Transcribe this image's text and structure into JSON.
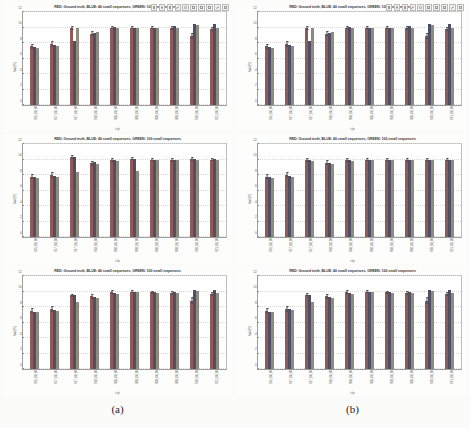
{
  "figure": {
    "captions": [
      {
        "label": "(a)"
      },
      {
        "label": "(b)"
      }
    ]
  },
  "toolbar": {
    "icons": [
      "save-icon",
      "zoom-icon",
      "pan-icon",
      "rotate-icon",
      "datacursor-icon",
      "colorbar-icon",
      "legend-icon",
      "hide-icon",
      "link-icon",
      "insert-icon"
    ]
  },
  "chart_data": [
    {
      "panel_id": "a-top",
      "type": "bar",
      "title": "RED: Ground truth, BLUE: 40 small sequences, GREEN: 100 small sequences",
      "xlabel": "clip",
      "ylabel": "Val (R)",
      "ylim": [
        0,
        12
      ],
      "yticks": [
        0,
        2,
        4,
        6,
        8,
        10,
        12
      ],
      "grid": true,
      "legend_position": "title",
      "categories": [
        "S15_08_00",
        "S17_08_00",
        "S17_08_00",
        "S18_08_00",
        "S08_08_00",
        "S08_08_00",
        "S08_08_00",
        "S08_08_00",
        "S20_08_00",
        "S21_08_00"
      ],
      "series": [
        {
          "name": "RED: Ground truth",
          "color": "#8f5a57",
          "values": [
            7.6,
            7.9,
            9.9,
            9.2,
            10.0,
            10.0,
            10.0,
            9.9,
            8.9,
            9.8
          ]
        },
        {
          "name": "BLUE: 40 small sequences",
          "color": "#4f4f63",
          "values": [
            7.5,
            7.7,
            8.3,
            9.3,
            10.1,
            10.0,
            10.0,
            10.2,
            10.4,
            10.4
          ]
        },
        {
          "name": "GREEN: 100 small sequences",
          "color": "#8b8b80",
          "values": [
            7.4,
            7.6,
            9.9,
            9.4,
            9.9,
            10.0,
            10.0,
            9.9,
            10.3,
            9.9
          ]
        }
      ],
      "errors": [
        {
          "series": "RED: Ground truth",
          "values": [
            0.5,
            0.6,
            0.3,
            0.4,
            0.25,
            0.2,
            0.2,
            0.3,
            0.6,
            0.3
          ]
        }
      ]
    },
    {
      "panel_id": "a-middle",
      "type": "bar",
      "title": "RED: Ground truth, BLUE: 40 small sequences, GREEN: 100 small sequences",
      "xlabel": "clip",
      "ylabel": "Val (R)",
      "ylim": [
        0,
        12
      ],
      "yticks": [
        0,
        2,
        4,
        6,
        8,
        10,
        12
      ],
      "grid": true,
      "legend_position": "title",
      "categories": [
        "S15_08_00",
        "S17_08_00",
        "S17_08_00",
        "S18_08_00",
        "S08_08_00",
        "S08_08_00",
        "S08_08_00",
        "S08_08_00",
        "S20_08_00",
        "S21_08_00"
      ],
      "series": [
        {
          "name": "RED: Ground truth",
          "color": "#8f5a57",
          "values": [
            7.8,
            8.0,
            10.3,
            9.5,
            9.9,
            10.1,
            10.0,
            9.9,
            10.1,
            10.0
          ]
        },
        {
          "name": "BLUE: 40 small sequences",
          "color": "#4f4f63",
          "values": [
            7.7,
            7.9,
            10.3,
            9.7,
            10.0,
            10.1,
            10.0,
            9.9,
            10.1,
            10.1
          ]
        },
        {
          "name": "GREEN: 100 small sequences",
          "color": "#8b8b80",
          "values": [
            7.6,
            7.8,
            8.4,
            9.4,
            9.8,
            8.5,
            10.0,
            9.9,
            10.0,
            9.9
          ]
        }
      ],
      "errors": [
        {
          "series": "RED: Ground truth",
          "values": [
            0.5,
            0.6,
            0.3,
            0.4,
            0.3,
            0.25,
            0.25,
            0.3,
            0.3,
            0.3
          ]
        }
      ]
    },
    {
      "panel_id": "a-bottom",
      "type": "bar",
      "title": "RED: Ground truth, BLUE: 40 small sequences, GREEN: 100 small sequences",
      "xlabel": "clip",
      "ylabel": "Val (R)",
      "ylim": [
        0,
        12
      ],
      "yticks": [
        0,
        2,
        4,
        6,
        8,
        10,
        12
      ],
      "grid": true,
      "legend_position": "title",
      "categories": [
        "S15_08_00",
        "S17_08_00",
        "S17_08_00",
        "S18_08_00",
        "S08_08_00",
        "S08_08_00",
        "S08_08_00",
        "S08_08_00",
        "S20_08_00",
        "S21_08_00"
      ],
      "series": [
        {
          "name": "RED: Ground truth",
          "color": "#8f5a57",
          "values": [
            7.5,
            7.7,
            9.5,
            9.4,
            9.9,
            10.0,
            9.9,
            9.8,
            8.8,
            9.7
          ]
        },
        {
          "name": "BLUE: 40 small sequences",
          "color": "#4f4f63",
          "values": [
            7.4,
            7.6,
            9.5,
            9.3,
            9.8,
            10.0,
            9.9,
            9.9,
            10.2,
            10.2
          ]
        },
        {
          "name": "GREEN: 100 small sequences",
          "color": "#8b8b80",
          "values": [
            7.3,
            7.5,
            8.6,
            9.2,
            9.7,
            9.9,
            9.8,
            9.8,
            10.1,
            9.8
          ]
        }
      ],
      "errors": [
        {
          "series": "RED: Ground truth",
          "values": [
            0.5,
            0.6,
            0.3,
            0.4,
            0.3,
            0.25,
            0.25,
            0.3,
            0.6,
            0.35
          ]
        }
      ]
    },
    {
      "panel_id": "b-top",
      "type": "bar",
      "title": "RED: Ground truth, BLUE: 40 small sequences, GREEN: 100 small sequences",
      "xlabel": "clip",
      "ylabel": "Val (R)",
      "ylim": [
        0,
        12
      ],
      "yticks": [
        0,
        2,
        4,
        6,
        8,
        10,
        12
      ],
      "grid": true,
      "legend_position": "title",
      "categories": [
        "S15_08_00",
        "S17_08_00",
        "S17_08_00",
        "S18_08_00",
        "S08_08_00",
        "S08_08_00",
        "S08_08_00",
        "S08_08_00",
        "S20_08_00",
        "S21_08_00"
      ],
      "series": [
        {
          "name": "RED: Ground truth",
          "color": "#8f5a57",
          "values": [
            7.6,
            7.9,
            9.9,
            9.2,
            10.0,
            10.0,
            10.0,
            9.9,
            8.9,
            9.8
          ]
        },
        {
          "name": "BLUE: 40 small sequences",
          "color": "#4f4f63",
          "values": [
            7.5,
            7.7,
            8.3,
            9.3,
            10.1,
            10.0,
            10.0,
            10.2,
            10.4,
            10.4
          ]
        },
        {
          "name": "GREEN: 100 small sequences",
          "color": "#8b8b80",
          "values": [
            7.4,
            7.6,
            9.9,
            9.4,
            9.9,
            10.0,
            10.0,
            9.9,
            10.3,
            9.9
          ]
        }
      ],
      "errors": [
        {
          "series": "RED: Ground truth",
          "values": [
            0.5,
            0.6,
            0.3,
            0.4,
            0.25,
            0.2,
            0.2,
            0.3,
            0.6,
            0.3
          ]
        }
      ]
    },
    {
      "panel_id": "b-middle",
      "type": "bar",
      "title": "RED: Ground truth, BLUE: 40 small sequences, GREEN: 100 small sequences",
      "xlabel": "clip",
      "ylabel": "Val (R)",
      "ylim": [
        0,
        12
      ],
      "yticks": [
        0,
        2,
        4,
        6,
        8,
        10,
        12
      ],
      "grid": true,
      "legend_position": "title",
      "categories": [
        "S15_08_00",
        "S17_08_00",
        "S17_08_00",
        "S18_08_00",
        "S08_08_00",
        "S08_08_00",
        "S08_08_00",
        "S08_08_00",
        "S20_08_00",
        "S21_08_00"
      ],
      "series": [
        {
          "name": "RED: Ground truth",
          "color": "#8f5a57",
          "values": [
            7.8,
            8.0,
            9.9,
            9.6,
            9.9,
            10.0,
            10.0,
            9.9,
            10.0,
            10.0
          ]
        },
        {
          "name": "BLUE: 40 small sequences",
          "color": "#4f4f63",
          "values": [
            7.7,
            7.9,
            9.9,
            9.5,
            9.9,
            10.0,
            10.0,
            10.0,
            10.0,
            10.0
          ]
        },
        {
          "name": "GREEN: 100 small sequences",
          "color": "#8b8b80",
          "values": [
            7.6,
            7.8,
            9.8,
            9.4,
            9.8,
            9.9,
            9.9,
            9.9,
            9.9,
            9.9
          ]
        }
      ],
      "errors": [
        {
          "series": "RED: Ground truth",
          "values": [
            0.5,
            0.6,
            0.3,
            0.4,
            0.3,
            0.25,
            0.25,
            0.3,
            0.3,
            0.3
          ]
        }
      ]
    },
    {
      "panel_id": "b-bottom",
      "type": "bar",
      "title": "RED: Ground truth, BLUE: 40 small sequences, GREEN: 100 small sequences",
      "xlabel": "clip",
      "ylabel": "Val (R)",
      "ylim": [
        0,
        12
      ],
      "yticks": [
        0,
        2,
        4,
        6,
        8,
        10,
        12
      ],
      "grid": true,
      "legend_position": "title",
      "categories": [
        "S15_08_00",
        "S17_08_00",
        "S17_08_00",
        "S18_08_00",
        "S08_08_00",
        "S08_08_00",
        "S08_08_00",
        "S08_08_00",
        "S20_08_00",
        "S21_08_00"
      ],
      "series": [
        {
          "name": "RED: Ground truth",
          "color": "#8f5a57",
          "values": [
            7.5,
            7.8,
            9.6,
            9.4,
            9.9,
            10.0,
            9.9,
            9.8,
            8.8,
            9.7
          ]
        },
        {
          "name": "BLUE: 40 small sequences",
          "color": "#4f4f63",
          "values": [
            7.4,
            7.7,
            9.5,
            9.3,
            9.8,
            10.0,
            9.9,
            9.9,
            10.2,
            10.2
          ]
        },
        {
          "name": "GREEN: 100 small sequences",
          "color": "#8b8b80",
          "values": [
            7.3,
            7.6,
            8.7,
            9.2,
            9.7,
            9.9,
            9.8,
            9.8,
            10.1,
            9.8
          ]
        }
      ],
      "errors": [
        {
          "series": "RED: Ground truth",
          "values": [
            0.5,
            0.6,
            0.3,
            0.4,
            0.3,
            0.25,
            0.25,
            0.3,
            0.6,
            0.35
          ]
        }
      ]
    }
  ]
}
